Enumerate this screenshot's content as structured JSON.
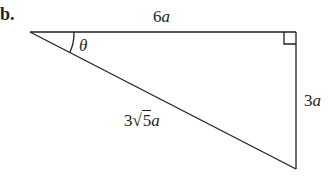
{
  "figure": {
    "part_label": "b.",
    "shape": "right-triangle",
    "vertices": {
      "left": [
        30,
        32
      ],
      "right_angle": [
        296,
        32
      ],
      "bottom": [
        296,
        169
      ]
    },
    "labels": {
      "top_side": {
        "coef": "6",
        "var": "a"
      },
      "right_side": {
        "coef": "3",
        "var": "a"
      },
      "hypotenuse": {
        "coef": "3",
        "root_symbol": "√",
        "radicand": "5",
        "var": "a"
      },
      "angle": "θ"
    },
    "colors": {
      "stroke": "#231f20",
      "background": "#ffffff"
    }
  }
}
